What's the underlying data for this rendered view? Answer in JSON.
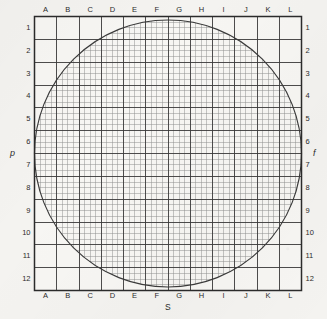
{
  "figure": {
    "name": "grid-chart-with-inscribed-circle",
    "background_color": "#f4f3f0",
    "ink_color": "#2b2b2b"
  },
  "axis_titles": {
    "left": "p",
    "right": "f",
    "bottom": "S"
  },
  "chart_data": {
    "type": "table",
    "title": "",
    "subtitle": "",
    "xlabel": "S",
    "ylabel": "p",
    "y2label": "f",
    "grid": true,
    "legend": null,
    "columns": [
      "A",
      "B",
      "C",
      "D",
      "E",
      "F",
      "G",
      "H",
      "I",
      "J",
      "K",
      "L"
    ],
    "rows": [
      "1",
      "2",
      "3",
      "4",
      "5",
      "6",
      "7",
      "8",
      "9",
      "10",
      "11",
      "12"
    ],
    "major_divisions_x": 12,
    "major_divisions_y": 12,
    "minor_per_major": 4,
    "xlim": [
      0,
      12
    ],
    "ylim": [
      0,
      12
    ],
    "annotations": [
      {
        "shape": "circle",
        "label": "inscribed-circle",
        "center_x": 6,
        "center_y": 6,
        "radius": 6
      }
    ]
  },
  "top_labels": [
    "A",
    "B",
    "C",
    "D",
    "E",
    "F",
    "G",
    "H",
    "I",
    "J",
    "K",
    "L"
  ],
  "bottom_labels": [
    "A",
    "B",
    "C",
    "D",
    "E",
    "F",
    "G",
    "H",
    "I",
    "J",
    "K",
    "L"
  ],
  "left_labels": [
    "1",
    "2",
    "3",
    "4",
    "5",
    "6",
    "7",
    "8",
    "9",
    "10",
    "11",
    "12"
  ],
  "right_labels": [
    "1",
    "2",
    "3",
    "4",
    "5",
    "6",
    "7",
    "8",
    "9",
    "10",
    "11",
    "12"
  ]
}
